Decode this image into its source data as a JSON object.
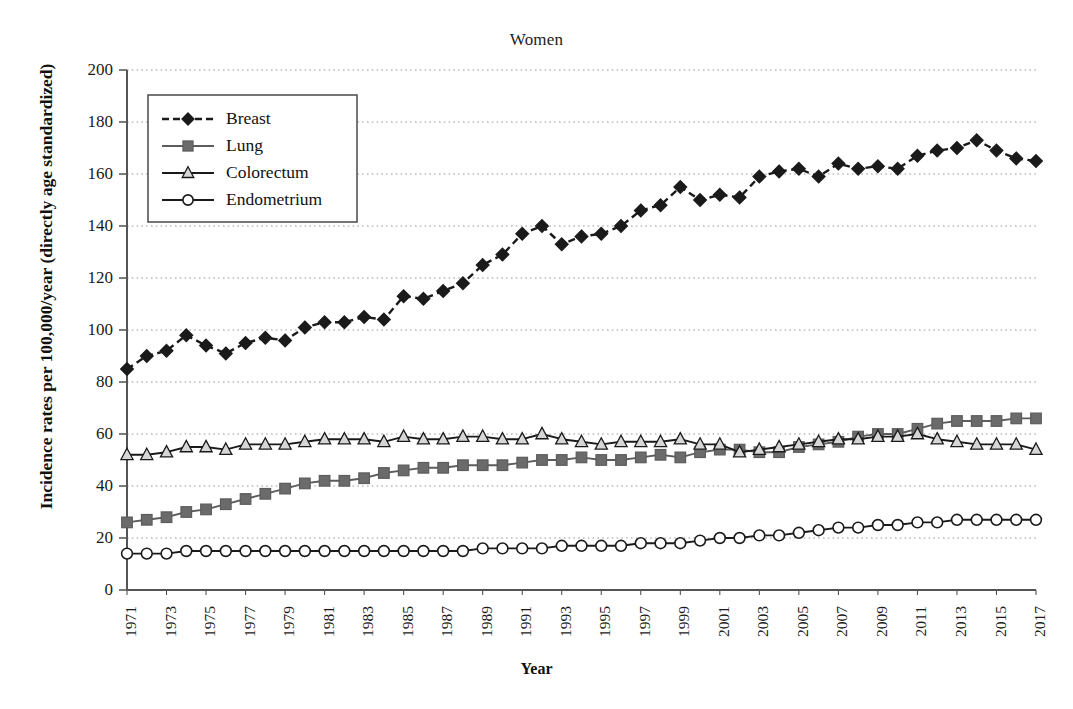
{
  "chart_data": {
    "type": "line",
    "title": "Women",
    "xlabel": "Year",
    "ylabel": "Incidence rates per 100,000/year (directly age standardized)",
    "grid": true,
    "legend_position": "upper left",
    "xlim": [
      1971,
      2017
    ],
    "ylim": [
      0,
      200
    ],
    "ytick_step": 20,
    "xtick_step": 2,
    "yticks": [
      0,
      20,
      40,
      60,
      80,
      100,
      120,
      140,
      160,
      180,
      200
    ],
    "xticks": [
      1971,
      1973,
      1975,
      1977,
      1979,
      1981,
      1983,
      1985,
      1987,
      1989,
      1991,
      1993,
      1995,
      1997,
      1999,
      2001,
      2003,
      2005,
      2007,
      2009,
      2011,
      2013,
      2015,
      2017
    ],
    "x": [
      1971,
      1972,
      1973,
      1974,
      1975,
      1976,
      1977,
      1978,
      1979,
      1980,
      1981,
      1982,
      1983,
      1984,
      1985,
      1986,
      1987,
      1988,
      1989,
      1990,
      1991,
      1992,
      1993,
      1994,
      1995,
      1996,
      1997,
      1998,
      1999,
      2000,
      2001,
      2002,
      2003,
      2004,
      2005,
      2006,
      2007,
      2008,
      2009,
      2010,
      2011,
      2012,
      2013,
      2014,
      2015,
      2016,
      2017
    ],
    "series": [
      {
        "name": "Breast",
        "color": "#1a1a1a",
        "marker": "diamond",
        "marker_fill": "#1a1a1a",
        "linestyle": "dashed",
        "values": [
          85,
          90,
          92,
          98,
          94,
          91,
          95,
          97,
          96,
          101,
          103,
          103,
          105,
          104,
          113,
          112,
          115,
          118,
          125,
          129,
          137,
          140,
          133,
          136,
          137,
          140,
          146,
          148,
          155,
          150,
          152,
          151,
          159,
          161,
          162,
          159,
          164,
          162,
          163,
          162,
          167,
          169,
          170,
          173,
          169,
          166,
          165
        ]
      },
      {
        "name": "Lung",
        "color": "#5c5c5c",
        "marker": "square",
        "marker_fill": "#6b6b6b",
        "linestyle": "solid",
        "values": [
          26,
          27,
          28,
          30,
          31,
          33,
          35,
          37,
          39,
          41,
          42,
          42,
          43,
          45,
          46,
          47,
          47,
          48,
          48,
          48,
          49,
          50,
          50,
          51,
          50,
          50,
          51,
          52,
          51,
          53,
          54,
          54,
          53,
          53,
          55,
          56,
          57,
          59,
          60,
          60,
          62,
          64,
          65,
          65,
          65,
          66,
          66
        ]
      },
      {
        "name": "Colorectum",
        "color": "#1a1a1a",
        "marker": "triangle",
        "marker_fill": "#d6d6d6",
        "linestyle": "solid",
        "values": [
          52,
          52,
          53,
          55,
          55,
          54,
          56,
          56,
          56,
          57,
          58,
          58,
          58,
          57,
          59,
          58,
          58,
          59,
          59,
          58,
          58,
          60,
          58,
          57,
          56,
          57,
          57,
          57,
          58,
          56,
          56,
          53,
          54,
          55,
          56,
          57,
          58,
          58,
          59,
          59,
          60,
          58,
          57,
          56,
          56,
          56,
          54
        ]
      },
      {
        "name": "Endometrium",
        "color": "#1a1a1a",
        "marker": "circle",
        "marker_fill": "#ffffff",
        "linestyle": "solid",
        "values": [
          14,
          14,
          14,
          15,
          15,
          15,
          15,
          15,
          15,
          15,
          15,
          15,
          15,
          15,
          15,
          15,
          15,
          15,
          16,
          16,
          16,
          16,
          17,
          17,
          17,
          17,
          18,
          18,
          18,
          19,
          20,
          20,
          21,
          21,
          22,
          23,
          24,
          24,
          25,
          25,
          26,
          26,
          27,
          27,
          27,
          27,
          27
        ]
      }
    ]
  }
}
